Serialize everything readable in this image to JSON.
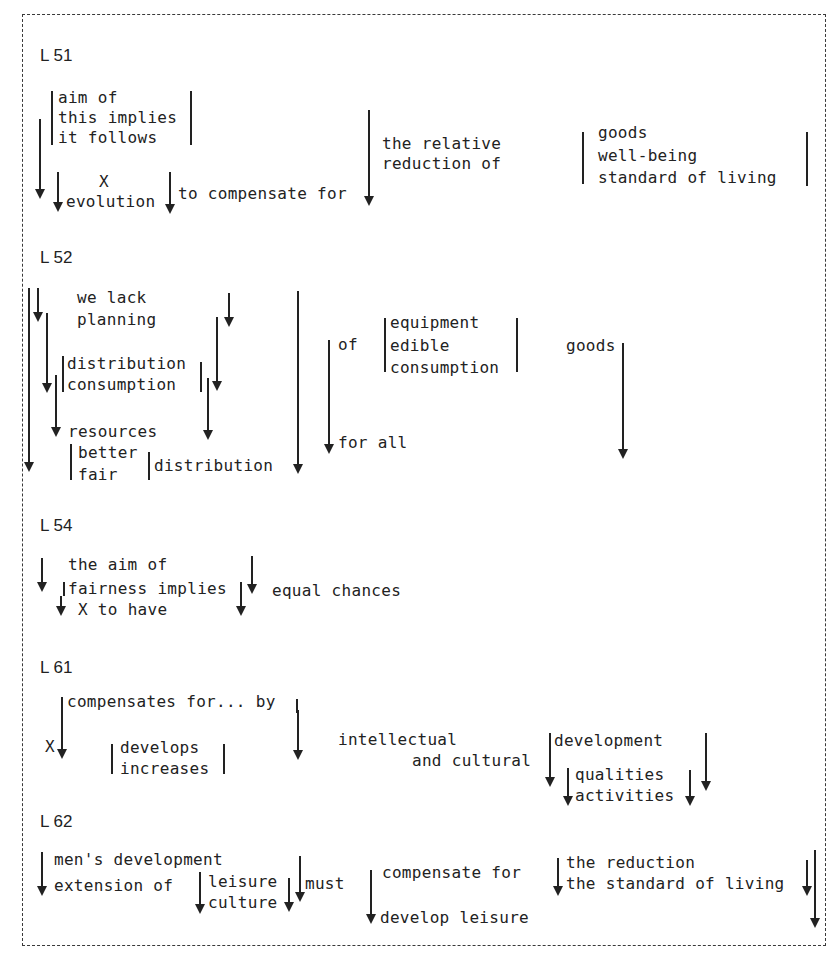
{
  "figure": {
    "type": "linguistic-derivation-diagram",
    "sections": [
      {
        "label": "L 51",
        "texts": {
          "alt_stack": [
            "aim of",
            "this implies",
            "it follows"
          ],
          "x": "X",
          "evolution": "evolution",
          "compensate": "to compensate for",
          "relative": [
            "the relative",
            "reduction of"
          ],
          "goods_stack": [
            "goods",
            "well-being",
            "standard of living"
          ]
        }
      },
      {
        "label": "L 52",
        "texts": {
          "lack": [
            "we lack",
            "planning"
          ],
          "dist_stack": [
            "distribution",
            "consumption"
          ],
          "resources": "resources",
          "fair_stack": [
            "better",
            "fair"
          ],
          "distribution": "distribution",
          "of": "of",
          "equip_stack": [
            "equipment",
            "edible",
            "consumption"
          ],
          "goods": "goods",
          "for_all": "for all"
        }
      },
      {
        "label": "L 54",
        "texts": {
          "aim": [
            "the aim of",
            "fairness implies"
          ],
          "x_have": "X to have",
          "equal": "equal chances"
        }
      },
      {
        "label": "L 61",
        "texts": {
          "compensates": "compensates for... by",
          "x": "X",
          "dev_stack": [
            "develops",
            "increases"
          ],
          "intellectual": [
            "intellectual",
            "and cultural"
          ],
          "development": "development",
          "qual_stack": [
            "qualities",
            "activities"
          ]
        }
      },
      {
        "label": "L 62",
        "texts": {
          "mens": "men's development",
          "extension": "extension of",
          "leisure_stack": [
            "leisure",
            "culture"
          ],
          "must": "must",
          "compensate": "compensate for",
          "develop_leisure": "develop leisure",
          "reduction_stack": [
            "the reduction",
            "the standard of living"
          ]
        }
      }
    ]
  }
}
